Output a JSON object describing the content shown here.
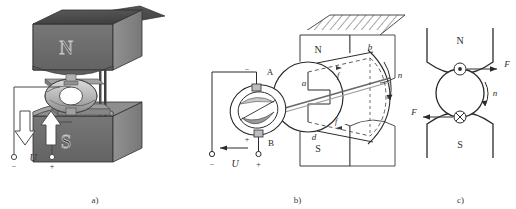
{
  "figure": {
    "background_color": "#ffffff",
    "ink_color": "#2b2b2b"
  },
  "panels": [
    {
      "id": "a",
      "caption": "a)",
      "description": "Perspective view of permanent magnet with armature and brushes",
      "labels": {
        "north_pole": "N",
        "south_pole": "S",
        "voltage": "U",
        "terminal_negative": "−",
        "terminal_positive": "+"
      },
      "colors": {
        "magnet_front": "#6e6e6e",
        "magnet_top": "#4d4d4d",
        "magnet_side": "#8a8a8a",
        "armature_light": "#cfcfcf",
        "armature_mid": "#a8a8a8",
        "armature_dark": "#7d7d7d"
      },
      "arrows": {
        "left_arrow_direction": "down",
        "right_arrow_direction": "up"
      }
    },
    {
      "id": "b",
      "caption": "b)",
      "description": "Perspective cutaway showing coil loop abcd, commutator and brushes A, B",
      "labels": {
        "north_pole": "N",
        "south_pole": "S",
        "brush_top": "A",
        "brush_bottom": "B",
        "coil_a": "a",
        "coil_b": "b",
        "coil_c": "c",
        "coil_d": "d",
        "rotation": "n",
        "current_f1": "f",
        "current_f2": "f",
        "voltage": "U",
        "terminal_negative": "−",
        "terminal_positive": "+",
        "brush_sign_top": "−",
        "brush_sign_bottom": "+"
      }
    },
    {
      "id": "c",
      "caption": "c)",
      "description": "Cross-section end view showing force directions on conductors",
      "labels": {
        "north_pole": "N",
        "south_pole": "S",
        "force_right": "F",
        "force_left": "F",
        "rotation": "n",
        "conductor_out_symbol": "dot",
        "conductor_in_symbol": "cross"
      }
    }
  ]
}
